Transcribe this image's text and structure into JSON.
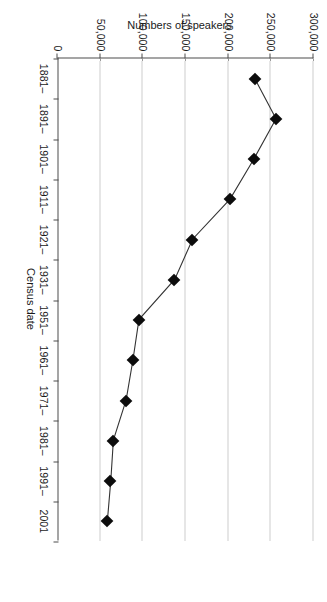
{
  "chart_data": {
    "type": "line",
    "title": "",
    "subtitle": "",
    "xlabel": "Census date",
    "ylabel": "Numbers of speakers",
    "categories": [
      "1881–",
      "1891–",
      "1901–",
      "1911–",
      "1921–",
      "1931–",
      "1951–",
      "1961–",
      "1971–",
      "1981–",
      "1991–",
      "2001"
    ],
    "values": [
      231000,
      256000,
      230000,
      202000,
      158000,
      137000,
      95000,
      88000,
      80000,
      65000,
      62000,
      58000
    ],
    "series": [
      {
        "name": "Numbers of speakers",
        "values": [
          231000,
          256000,
          230000,
          202000,
          158000,
          137000,
          95000,
          88000,
          80000,
          65000,
          62000,
          58000
        ],
        "marker": "diamond",
        "marker_color": "#0c0c0c",
        "line_color": "#333333"
      }
    ],
    "ylim": [
      0,
      300000
    ],
    "yticks": [
      0,
      50000,
      100000,
      150000,
      200000,
      250000,
      300000
    ],
    "ytick_labels": [
      "0",
      "50,000",
      "100,000",
      "150,000",
      "200,000",
      "250,000",
      "300,000"
    ],
    "xtick_labels": [
      "1881–",
      "1891–",
      "1901–",
      "1911–",
      "1921–",
      "1931–",
      "1951–",
      "1961–",
      "1971–",
      "1981–",
      "1991–",
      "2001"
    ],
    "grid": "horizontal-dotted",
    "legend": "none",
    "legend_position": "none",
    "orientation_note": "figure rotated 90 degrees in source image",
    "colors": {
      "axis": "#4d4d4d",
      "gridline": "#9a9a9a",
      "marker": "#0c0c0c",
      "line": "#333333",
      "background": "#ffffff",
      "text": "#1a1a1a"
    }
  }
}
